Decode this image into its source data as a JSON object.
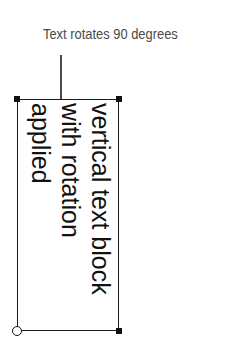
{
  "caption": {
    "text": "Text rotates 90 degrees",
    "color": "#4a4a4a"
  },
  "text_block": {
    "lines": [
      "vertical text block",
      "with rotation",
      "applied"
    ],
    "rotation_degrees": 90,
    "text_color": "#111111",
    "border_color": "#1a1a1a"
  },
  "handles": [
    "top-left",
    "top-right",
    "bottom-right",
    "bottom-left-origin"
  ]
}
